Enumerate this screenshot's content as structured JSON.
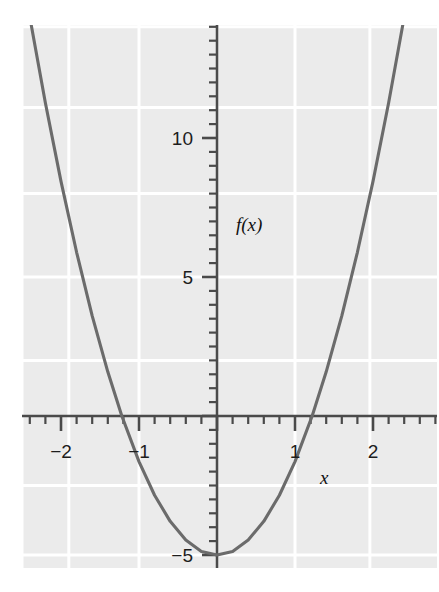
{
  "chart_data": {
    "type": "line",
    "title": "",
    "subtitle": "",
    "xlabel": "x",
    "ylabel": "f(x)",
    "function_label": "f(x)",
    "equation": "f(x) = 3.36x^2 - 5",
    "xlim": [
      -2.78,
      2.84
    ],
    "ylim": [
      -6.2,
      14.95
    ],
    "grid": true,
    "legend": null,
    "x_ticks_major": [
      -2,
      -1,
      1,
      2
    ],
    "x_tick_labels": [
      "-2",
      "-1",
      "1",
      "2"
    ],
    "x_minor_step": 0.2,
    "y_ticks_major": [
      5,
      10
    ],
    "y_tick_labels": [
      "5",
      "10"
    ],
    "y_negative_tick_labels": [
      "-5"
    ],
    "y_negative_ticks": [
      -5
    ],
    "y_minor_step": 0.5,
    "vertex": [
      0,
      -5
    ],
    "roots": [
      -1.22,
      1.22
    ],
    "x": [
      -2.78,
      -2.6,
      -2.4,
      -2.2,
      -2.0,
      -1.8,
      -1.6,
      -1.4,
      -1.22,
      -1.0,
      -0.8,
      -0.6,
      -0.4,
      -0.2,
      0,
      0.2,
      0.4,
      0.6,
      0.8,
      1.0,
      1.22,
      1.4,
      1.6,
      1.8,
      2.0,
      2.2,
      2.4,
      2.6,
      2.78
    ],
    "y": [
      20.97,
      17.72,
      14.35,
      11.26,
      8.44,
      5.89,
      3.6,
      1.59,
      0,
      -1.64,
      -2.85,
      -3.79,
      -4.46,
      -4.87,
      -5,
      -4.87,
      -4.46,
      -3.79,
      -2.85,
      -1.64,
      0,
      1.59,
      3.6,
      5.89,
      8.44,
      11.26,
      14.35,
      17.72,
      20.97
    ]
  },
  "colors": {
    "panel_background": "#ebebeb",
    "gridline": "#ffffff",
    "axis": "#4a4a4a",
    "curve": "#6b6b6b",
    "tick_text": "#1d1d1d",
    "page_background": "#ffffff"
  },
  "axes": {
    "x_axis_name": "x",
    "y_axis_name": "f(x)"
  }
}
